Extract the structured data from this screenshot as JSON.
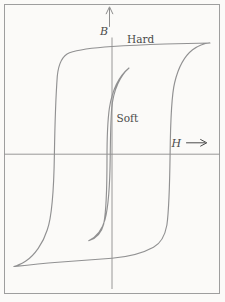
{
  "figure": {
    "type": "hysteresis-loop-diagram",
    "background_color": "#fbfaf8",
    "frame_color": "#9e9e9e",
    "axis_color": "#8d8d8d",
    "curve_color": "#919192",
    "label_color": "#4a4a4a",
    "labels": {
      "b_axis": "B",
      "h_axis": "H",
      "hard_curve": "Hard",
      "soft_curve": "Soft"
    },
    "icons": {
      "b_axis_arrow": "up-arrow",
      "h_axis_arrow": "right-arrow"
    },
    "curves": {
      "hard_loop_path": "M 210 43 C 200 43.3 183 43.6 165 44 C 141 44.8 124 45.7 112 46.5 C 97 47.5 79 49.4 69.5 52.8 C 62 55.8 58.6 63.5 57.3 76 C 55.9 95 54.9 124 54.4 154 C 53.9 188 51.6 218 47.2 230 C 43.2 243 34.5 255.5 25.5 261.3 C 20.8 264.2 16.8 265.9 13.8 266.5 C 22 265.6 38 263.8 58 262.2 C 83 260.3 100 259.3 112 258.3 C 129 256.9 143.5 252.8 153.5 247.3 C 160.5 243.5 164.9 236 166.9 225 C 168.9 210.5 169.7 184 170.1 154 C 170.5 121 171.9 93.5 174.7 82.5 C 177.7 70 183.6 56.8 192.6 49.8 C 197.8 45.8 203.8 43.3 210 43 Z",
      "soft_loop_path": "M 129 68 C 121 74.5 112.7 87.5 109.4 108 C 107.7 120 107 140 107 158 C 107 186 106.2 212 103.7 224 C 101.5 232.8 96.3 238.4 88.7 240.7 C 95.9 237.3 101.9 230.7 105 219.6 C 108.1 208 109.9 184 110.2 158 C 110.4 140 110.7 121 111.7 108.5 C 113.3 89.5 120.7 75 129 68 Z",
      "b_axis_path": "M 112 37.5 L 112 289",
      "h_axis_path": "M 4.5 154.2 L 219.5 154.2",
      "b_arrow_path": "M 109.5 26.5 L 109.5 8.5 M 106.2 13.8 L 109.5 6.8 L 112.8 13.8",
      "h_arrow_path": "M 186.5 142.8 L 204.8 142.8 M 200.6 139.5 L 206.8 142.8 L 200.6 146.1"
    }
  }
}
